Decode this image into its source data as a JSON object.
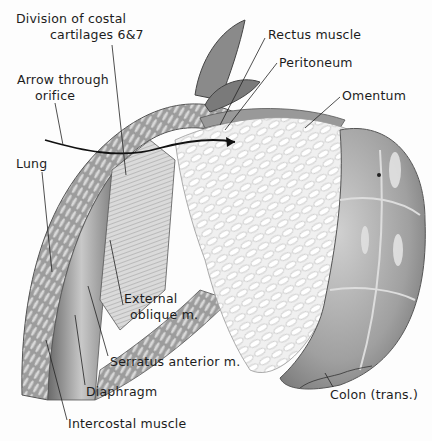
{
  "figure": {
    "type": "anatomical-illustration",
    "colors": {
      "background": "#fdfdfd",
      "ink": "#1c1c1c",
      "muscle_dark": "#5a5a5a",
      "muscle_mid": "#9a9a9a",
      "omentum": "#eeeeee",
      "colon": "#a8a8a8"
    },
    "labels": {
      "division_costal_line1": "Division of costal",
      "division_costal_line2": "cartilages 6&7",
      "arrow_orifice_line1": "Arrow through",
      "arrow_orifice_line2": "orifice",
      "lung": "Lung",
      "rectus_muscle": "Rectus muscle",
      "peritoneum": "Peritoneum",
      "omentum": "Omentum",
      "external_oblique_line1": "External",
      "external_oblique_line2": "oblique m.",
      "serratus_anterior": "Serratus anterior m.",
      "diaphragm": "Diaphragm",
      "intercostal_muscle": "Intercostal muscle",
      "colon": "Colon (trans.)"
    }
  }
}
